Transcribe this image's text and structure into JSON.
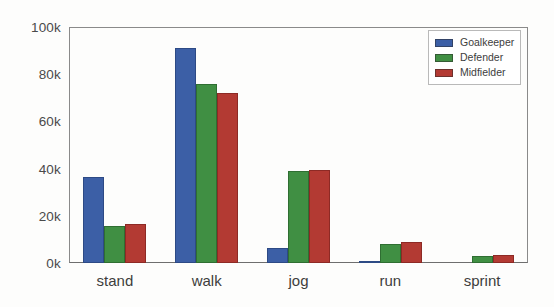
{
  "chart_data": {
    "type": "bar",
    "title": "",
    "xlabel": "",
    "ylabel": "",
    "categories": [
      "stand",
      "walk",
      "jog",
      "run",
      "sprint"
    ],
    "series": [
      {
        "name": "Goalkeeper",
        "color": "#3c5fa6",
        "values": [
          36500,
          91000,
          6500,
          1000,
          0
        ]
      },
      {
        "name": "Defender",
        "color": "#408f43",
        "values": [
          15500,
          76000,
          39000,
          8000,
          3000
        ]
      },
      {
        "name": "Midfielder",
        "color": "#b33a33",
        "values": [
          16500,
          72000,
          39500,
          9000,
          3500
        ]
      }
    ],
    "ylim": [
      0,
      100000
    ],
    "ytick_values": [
      0,
      20000,
      40000,
      60000,
      80000,
      100000
    ],
    "ytick_labels": [
      "0k",
      "20k",
      "40k",
      "60k",
      "80k",
      "100k"
    ],
    "grid": false,
    "legend_position": "upper right"
  },
  "legend": {
    "entries": [
      {
        "label": "Goalkeeper"
      },
      {
        "label": "Defender"
      },
      {
        "label": "Midfielder"
      }
    ]
  }
}
